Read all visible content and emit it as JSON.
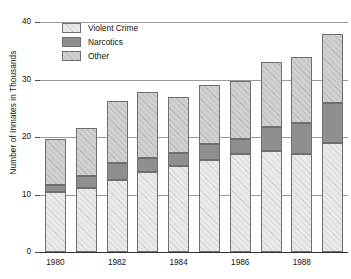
{
  "chart_data": {
    "type": "bar",
    "subtype": "stacked-bar",
    "title": "",
    "xlabel": "",
    "ylabel": "Number of Inmates in Thousands",
    "categories": [
      "1980",
      "1981",
      "1982",
      "1983",
      "1984",
      "1985",
      "1986",
      "1987",
      "1988",
      "1989"
    ],
    "tick_labels_shown": [
      "1980",
      "1982",
      "1984",
      "1986",
      "1988"
    ],
    "series": [
      {
        "name": "Violent Crime",
        "color": "#e9e9e9",
        "values": [
          10.5,
          11.2,
          12.5,
          14.0,
          15.0,
          16.0,
          17.0,
          17.5,
          17.1,
          19.0
        ]
      },
      {
        "name": "Narcotics",
        "color": "#8f8f8f",
        "values": [
          1.2,
          2.1,
          3.0,
          2.4,
          2.2,
          2.7,
          2.7,
          4.3,
          5.4,
          7.0
        ]
      },
      {
        "name": "Other",
        "color": "#d0d0d0",
        "values": [
          8.0,
          8.2,
          10.8,
          11.4,
          9.8,
          10.3,
          10.0,
          11.2,
          11.5,
          12.0
        ]
      }
    ],
    "totals": [
      19.7,
      21.5,
      26.3,
      27.8,
      27.0,
      29.0,
      29.7,
      33.0,
      34.0,
      38.0
    ],
    "ylim": [
      0,
      40
    ],
    "yticks": [
      0,
      10,
      20,
      30,
      40
    ],
    "ytick_labels": [
      "0",
      "10",
      "20",
      "30",
      "40"
    ],
    "grid": true,
    "grid_axis": "y",
    "legend_position": "upper-left-inside"
  },
  "legend": {
    "items": [
      {
        "label": "Violent Crime",
        "swatch": "violent"
      },
      {
        "label": "Narcotics",
        "swatch": "narcotics"
      },
      {
        "label": "Other",
        "swatch": "other"
      }
    ]
  },
  "colors": {
    "violent_crime": "#e9e9e9",
    "narcotics": "#8f8f8f",
    "other": "#d0d0d0",
    "bar_outline": "#6f6f6f",
    "gridline": "#9a9a9a",
    "axis": "#333333",
    "text": "#111111"
  }
}
